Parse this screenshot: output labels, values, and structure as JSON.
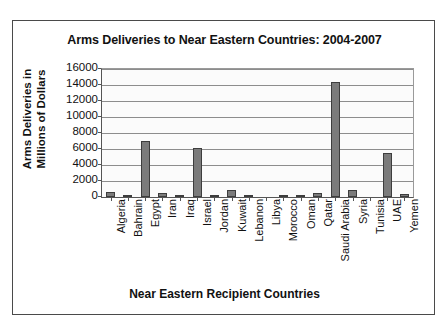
{
  "chart_data": {
    "type": "bar",
    "title": "Arms Deliveries to Near Eastern Countries: 2004-2007",
    "xlabel": "Near Eastern Recipient Countries",
    "ylabel_line1": "Arms Deliveries in",
    "ylabel_line2": "Millions of Dollars",
    "categories": [
      "Algeria",
      "Bahrain",
      "Egypt",
      "Iran",
      "Iraq",
      "Israel",
      "Jordan",
      "Kuwait",
      "Lebanon",
      "Libya",
      "Morocco",
      "Oman",
      "Qatar",
      "Saudi Arabia",
      "Syria",
      "Tunisia",
      "UAE",
      "Yemen"
    ],
    "values": [
      600,
      200,
      7000,
      500,
      300,
      6100,
      300,
      900,
      100,
      0,
      300,
      200,
      500,
      14400,
      900,
      0,
      5500,
      400
    ],
    "ylim": [
      0,
      16000
    ],
    "yticks": [
      0,
      2000,
      4000,
      6000,
      8000,
      10000,
      12000,
      14000,
      16000
    ],
    "ytick_labels": [
      "0",
      "2000",
      "4000",
      "6000",
      "8000",
      "10000",
      "12000",
      "14000",
      "16000"
    ],
    "grid": true,
    "legend": "none",
    "bar_color": "#7b7b7b",
    "bar_edge_color": "#3d3d3d",
    "plot_background": "#fbfbfb",
    "frame_color": "#4a4a4a"
  }
}
